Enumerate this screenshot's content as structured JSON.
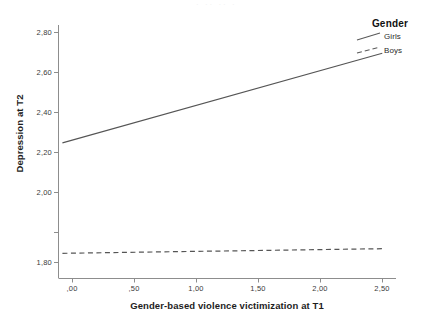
{
  "chart_data": {
    "type": "line",
    "title": "",
    "xlabel": "Gender-based violence victimization at T1",
    "ylabel": "Depression at T2",
    "xlim": [
      -0.15,
      2.72
    ],
    "ylim": [
      1.74,
      2.86
    ],
    "grid": false,
    "legend_position": "top-right",
    "legend_title": "Gender",
    "xticks": [
      0.0,
      0.5,
      1.0,
      1.5,
      2.0,
      2.5
    ],
    "xticklabels": [
      ",00",
      ",50",
      "1,00",
      "1,50",
      "2,00",
      "2,50"
    ],
    "yticks": [
      1.8,
      2.0,
      2.2,
      2.4,
      2.6,
      2.8
    ],
    "yticklabels": [
      "1,80",
      "2,00",
      "2,20",
      "2,40",
      "2,60",
      "2,80"
    ],
    "series": [
      {
        "name": "Girls",
        "style": "solid",
        "color": "#555555",
        "x": [
          -0.12,
          2.67
        ],
        "values": [
          2.32,
          2.71
        ]
      },
      {
        "name": "Boys",
        "style": "dashed",
        "color": "#555555",
        "x": [
          -0.12,
          2.67
        ],
        "values": [
          1.84,
          1.86
        ]
      }
    ]
  },
  "legend": {
    "title": "Gender",
    "items": [
      {
        "label": "Girls",
        "style": "solid"
      },
      {
        "label": "Boys",
        "style": "dashed"
      }
    ]
  },
  "axes": {
    "y_title": "Depression at T2",
    "x_title": "Gender-based violence victimization at T1",
    "y_labels": [
      "2,80",
      "2,60",
      "2,40",
      "2,20",
      "2,00",
      "1,80"
    ],
    "x_labels": [
      ",00",
      ",50",
      "1,00",
      "1,50",
      "2,00",
      "2,50"
    ]
  },
  "artifact": {
    "top_strip": "· ·· ·· ·"
  }
}
